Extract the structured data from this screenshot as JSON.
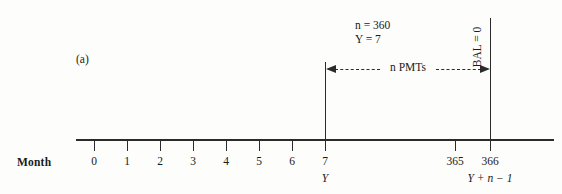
{
  "figure": {
    "panel_label": "(a)",
    "axis_name": "Month"
  },
  "annotations": {
    "n_value": "n = 360",
    "Y_value": "Y = 7",
    "balance": "BAL = 0",
    "span_caption": "n PMTs"
  },
  "chart_data": {
    "type": "timeline",
    "title": "",
    "xlabel": "Month",
    "axis": {
      "start_px": 76,
      "end_px": 554,
      "origin_tick_px": 94,
      "tick_spacing_px": 33
    },
    "ticks": [
      {
        "label": "0",
        "sublabel": "",
        "x": 94
      },
      {
        "label": "1",
        "sublabel": "",
        "x": 127
      },
      {
        "label": "2",
        "sublabel": "",
        "x": 160
      },
      {
        "label": "3",
        "sublabel": "",
        "x": 193
      },
      {
        "label": "4",
        "sublabel": "",
        "x": 226
      },
      {
        "label": "5",
        "sublabel": "",
        "x": 259
      },
      {
        "label": "6",
        "sublabel": "",
        "x": 292
      },
      {
        "label": "7",
        "sublabel": "Y",
        "x": 325
      },
      {
        "label": "365",
        "sublabel": "",
        "x": 455
      },
      {
        "label": "366",
        "sublabel": "Y + n − 1",
        "x": 490
      }
    ],
    "markers": [
      {
        "name": "first-payment",
        "month": 7,
        "x": 325
      },
      {
        "name": "last-payment",
        "month": 366,
        "x": 490
      }
    ],
    "span": {
      "from_month": 7,
      "to_month": 366,
      "label": "n PMTs"
    },
    "colors": {
      "ink": "#2b2b2b",
      "background": "#fdfdfb"
    }
  }
}
